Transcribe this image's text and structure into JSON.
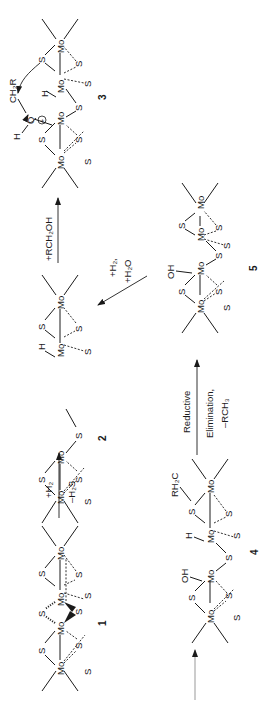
{
  "figure": {
    "orientation": "rotated -90deg",
    "colors": {
      "ink": "#1a1a1a",
      "arrow": "#333333",
      "background": "#ffffff"
    }
  },
  "structures": [
    {
      "id": "1",
      "label": "1",
      "atoms": [
        "Mo",
        "Mo",
        "Mo",
        "Mo",
        "S",
        "S",
        "S",
        "S",
        "S",
        "S",
        "S",
        "S"
      ]
    },
    {
      "id": "2",
      "label": "2",
      "atoms": [
        "Mo",
        "Mo",
        "Mo",
        "Mo",
        "S",
        "S",
        "S",
        "S",
        "S",
        "S",
        "S",
        "H"
      ]
    },
    {
      "id": "3",
      "label": "3",
      "atoms": [
        "Mo",
        "Mo",
        "Mo",
        "Mo",
        "S",
        "S",
        "S",
        "S",
        "S",
        "S",
        "S",
        "H",
        "O",
        "H",
        "CH2R"
      ]
    },
    {
      "id": "4",
      "label": "4",
      "atoms": [
        "Mo",
        "Mo",
        "Mo",
        "Mo",
        "S",
        "S",
        "S",
        "S",
        "S",
        "S",
        "S",
        "H",
        "OH",
        "RH2C"
      ]
    },
    {
      "id": "5",
      "label": "5",
      "atoms": [
        "Mo",
        "Mo",
        "Mo",
        "Mo",
        "S",
        "S",
        "S",
        "S",
        "S",
        "S",
        "S",
        "OH"
      ]
    }
  ],
  "arrows": [
    {
      "id": "entry",
      "from": "start",
      "to": "4",
      "labels": []
    },
    {
      "id": "a1",
      "from": "1",
      "to": "2",
      "labels": [
        "+H₂",
        "–H₂S"
      ]
    },
    {
      "id": "a2",
      "from": "2",
      "to": "3",
      "labels": [
        "+RCH₂OH"
      ]
    },
    {
      "id": "a3",
      "from": "4",
      "to": "5",
      "labels": [
        "Reductive",
        "Elimination,",
        "–RCH₃"
      ]
    },
    {
      "id": "a4",
      "from": "5",
      "to": "2",
      "labels": [
        "+H₂,",
        "+H₂O"
      ]
    }
  ],
  "text": {
    "mo": "Mo",
    "s": "S",
    "h": "H",
    "o": "O",
    "oh": "OH",
    "ch2r": "CH₂R",
    "rh2c": "RH₂C",
    "plus": "+",
    "n1": "1",
    "n2": "2",
    "n3": "3",
    "n4": "4",
    "n5": "5",
    "a1_top": "+H₂",
    "a1_bot": "–H₂S",
    "a2_top": "+RCH₂OH",
    "a3_top": "Reductive",
    "a3_mid": "Elimination,",
    "a3_bot": "–RCH₃",
    "a4_top": "+H₂,",
    "a4_bot": "+H₂O"
  }
}
